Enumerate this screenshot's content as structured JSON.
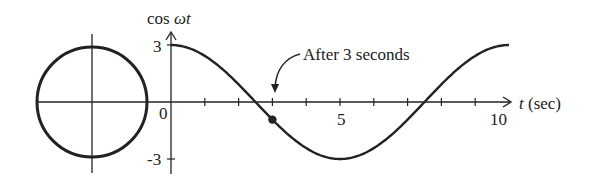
{
  "chart_data": {
    "type": "line",
    "title": "",
    "function": "3 cos(ωt), ω = 2π/10 rad/s",
    "xlabel": "t (sec)",
    "ylabel": "cos ωt",
    "xlim": [
      0,
      10
    ],
    "ylim": [
      -3,
      3
    ],
    "x_ticks": [
      1,
      2,
      3,
      4,
      5,
      6,
      7,
      8,
      9
    ],
    "x_tick_labels": [
      "0",
      "5",
      "10"
    ],
    "y_tick_labels": [
      "3",
      "0",
      "-3"
    ],
    "grid": false,
    "legend": null,
    "series": [
      {
        "name": "cos ωt",
        "x": [
          0,
          1,
          2,
          3,
          4,
          5,
          6,
          7,
          8,
          9,
          10
        ],
        "values": [
          3,
          2.43,
          0.93,
          -0.93,
          -2.43,
          -3,
          -2.43,
          -0.93,
          0.93,
          2.43,
          3
        ]
      }
    ],
    "highlight_point": {
      "t": 3,
      "value": -0.93
    },
    "annotations": [
      {
        "text": "After 3 seconds",
        "points_to_t": 3
      }
    ],
    "phasor_circle": {
      "radius": 3,
      "description": "reference circle left of plot"
    }
  },
  "labels": {
    "ylabel_prefix": "cos ",
    "ylabel_var": "ωt",
    "xlabel_var": "t",
    "xlabel_unit": " (sec)",
    "y_top": "3",
    "y_zero": "0",
    "y_bottom": "-3",
    "x_mid": "5",
    "x_end": "10",
    "annotation": "After 3 seconds"
  },
  "colors": {
    "ink": "#222222",
    "background": "#ffffff"
  }
}
